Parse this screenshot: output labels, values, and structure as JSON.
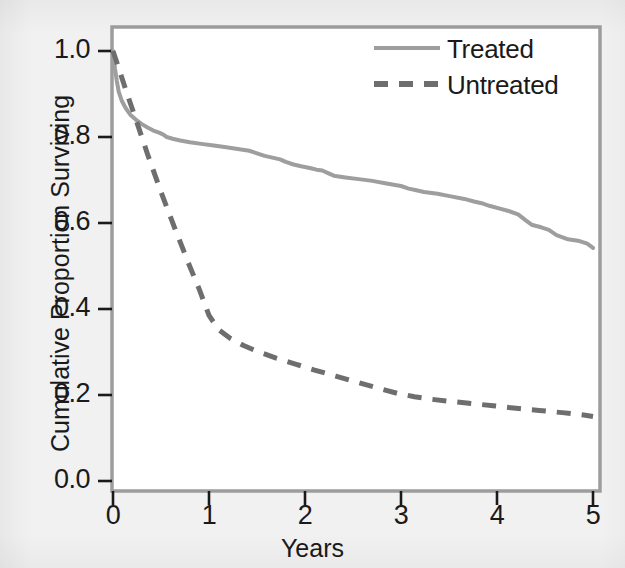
{
  "figure": {
    "background_color": "#f1f1f1",
    "plot_background_color": "#ffffff",
    "axis_color": "#9a9a9a",
    "text_color": "#1a1a1a"
  },
  "chart_data": {
    "type": "line",
    "title": "",
    "subtitle": "",
    "xlabel": "Years",
    "ylabel": "Cumulative Proportion Surviving",
    "xlim": [
      0,
      5
    ],
    "ylim": [
      0.0,
      1.06
    ],
    "xticks": [
      "0",
      "1",
      "2",
      "3",
      "4",
      "5"
    ],
    "xtick_values": [
      0,
      1,
      2,
      3,
      4,
      5
    ],
    "yticks": [
      "0.0",
      "0.2",
      "0.4",
      "0.6",
      "0.8",
      "1.0"
    ],
    "ytick_values": [
      0.0,
      0.2,
      0.4,
      0.6,
      0.8,
      1.0
    ],
    "grid": false,
    "legend_position": "top-right-inside",
    "series": [
      {
        "name": "Treated",
        "style": "solid",
        "color": "#9e9e9e",
        "linewidth": 4,
        "x": [
          0.0,
          0.02,
          0.04,
          0.06,
          0.09,
          0.13,
          0.18,
          0.24,
          0.3,
          0.36,
          0.42,
          0.48,
          0.52,
          0.56,
          0.62,
          0.7,
          0.8,
          0.92,
          1.05,
          1.18,
          1.3,
          1.42,
          1.5,
          1.58,
          1.66,
          1.74,
          1.8,
          1.88,
          1.96,
          2.05,
          2.12,
          2.18,
          2.24,
          2.3,
          2.42,
          2.56,
          2.7,
          2.85,
          3.0,
          3.08,
          3.16,
          3.24,
          3.38,
          3.52,
          3.66,
          3.76,
          3.84,
          3.92,
          4.02,
          4.12,
          4.22,
          4.3,
          4.36,
          4.46,
          4.54,
          4.62,
          4.74,
          4.86,
          4.94,
          5.0
        ],
        "y": [
          1.0,
          0.96,
          0.93,
          0.905,
          0.885,
          0.868,
          0.852,
          0.84,
          0.83,
          0.822,
          0.815,
          0.81,
          0.806,
          0.8,
          0.796,
          0.792,
          0.788,
          0.784,
          0.78,
          0.776,
          0.772,
          0.768,
          0.762,
          0.756,
          0.752,
          0.748,
          0.742,
          0.736,
          0.732,
          0.728,
          0.724,
          0.722,
          0.716,
          0.71,
          0.706,
          0.702,
          0.698,
          0.692,
          0.686,
          0.68,
          0.676,
          0.672,
          0.668,
          0.662,
          0.656,
          0.65,
          0.646,
          0.64,
          0.634,
          0.628,
          0.62,
          0.606,
          0.596,
          0.59,
          0.584,
          0.572,
          0.562,
          0.558,
          0.552,
          0.542
        ]
      },
      {
        "name": "Untreated",
        "style": "dashed",
        "color": "#6e6e6e",
        "linewidth": 5,
        "x": [
          0.0,
          0.06,
          0.14,
          0.24,
          0.36,
          0.5,
          0.64,
          0.78,
          0.9,
          1.0,
          1.1,
          1.22,
          1.36,
          1.52,
          1.7,
          1.9,
          2.1,
          2.32,
          2.54,
          2.76,
          2.96,
          3.14,
          3.32,
          3.52,
          3.74,
          3.96,
          4.2,
          4.44,
          4.68,
          4.92,
          5.0
        ],
        "y": [
          1.0,
          0.96,
          0.905,
          0.84,
          0.76,
          0.672,
          0.59,
          0.51,
          0.445,
          0.385,
          0.352,
          0.332,
          0.315,
          0.3,
          0.286,
          0.272,
          0.258,
          0.244,
          0.23,
          0.216,
          0.204,
          0.196,
          0.19,
          0.185,
          0.18,
          0.175,
          0.169,
          0.164,
          0.159,
          0.153,
          0.15
        ]
      }
    ]
  },
  "legend": {
    "entries": [
      {
        "label": "Treated",
        "style": "solid",
        "color": "#9e9e9e"
      },
      {
        "label": "Untreated",
        "style": "dashed",
        "color": "#6e6e6e"
      }
    ]
  }
}
